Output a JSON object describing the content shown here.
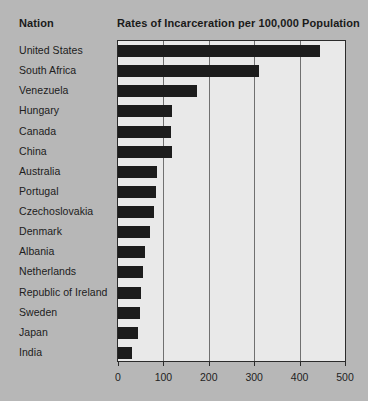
{
  "header": {
    "nation_label": "Nation",
    "title": "Rates of Incarceration per 100,000 Population"
  },
  "colors": {
    "page_background": "#b7b7b7",
    "plot_background": "#e9e9e9",
    "bar_fill": "#1c1c1c",
    "gridline": "#707070",
    "axis_line": "#2b2b2b",
    "text": "#1f1f1f"
  },
  "chart_data": {
    "type": "bar",
    "orientation": "horizontal",
    "title": "Rates of Incarceration per 100,000 Population",
    "xlabel": "",
    "ylabel": "Nation",
    "xlim": [
      0,
      500
    ],
    "xticks": [
      0,
      100,
      200,
      300,
      400,
      500
    ],
    "xtick_labels": [
      "0",
      "100",
      "200",
      "300",
      "400",
      "500"
    ],
    "grid": true,
    "legend": false,
    "categories": [
      "United States",
      "South Africa",
      "Venezuela",
      "Hungary",
      "Canada",
      "China",
      "Australia",
      "Portugal",
      "Czechoslovakia",
      "Denmark",
      "Albania",
      "Netherlands",
      "Republic of Ireland",
      "Sweden",
      "Japan",
      "India"
    ],
    "values": [
      445,
      311,
      174,
      120,
      116,
      118,
      86,
      83,
      79,
      71,
      60,
      56,
      51,
      49,
      45,
      31
    ]
  }
}
